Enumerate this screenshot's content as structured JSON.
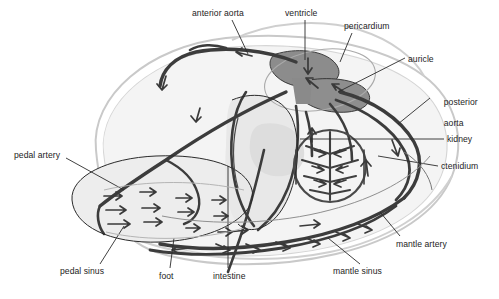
{
  "figure": {
    "type": "anatomical-line-diagram",
    "organism": "bivalve mollusc",
    "colors": {
      "background": "#ffffff",
      "shell_outline": "#c9c9c9",
      "body_fill": "#f2f2f2",
      "visceral_fill": "#e4e4e4",
      "heart_fill": "#8e8e8e",
      "vessel_dark": "#3a3a3a",
      "vessel_mid": "#555555",
      "outline": "#2b2b2b",
      "label_text": "#1d1d1d",
      "leader_line": "#2b2b2b"
    }
  },
  "labels": [
    {
      "id": "anterior-aorta",
      "text": "anterior aorta",
      "x": 192,
      "y": 8,
      "lines": [
        "anterior aorta"
      ]
    },
    {
      "id": "ventricle",
      "text": "ventricle",
      "x": 285,
      "y": 8,
      "lines": [
        "ventricle"
      ]
    },
    {
      "id": "pericardium",
      "text": "pericardium",
      "x": 344,
      "y": 21,
      "lines": [
        "pericardium"
      ]
    },
    {
      "id": "auricle",
      "text": "auricle",
      "x": 408,
      "y": 54,
      "lines": [
        "auricle"
      ]
    },
    {
      "id": "posterior-aorta",
      "text": "posterior aorta",
      "x": 434,
      "y": 88,
      "lines": [
        "posterior",
        "aorta"
      ]
    },
    {
      "id": "kidney",
      "text": "kidney",
      "x": 447,
      "y": 134,
      "lines": [
        "kidney"
      ]
    },
    {
      "id": "ctenidium",
      "text": "ctenidium",
      "x": 441,
      "y": 162,
      "lines": [
        "ctenidium"
      ]
    },
    {
      "id": "mantle-artery",
      "text": "mantle artery",
      "x": 396,
      "y": 240,
      "lines": [
        "mantle artery"
      ]
    },
    {
      "id": "mantle-sinus",
      "text": "mantle sinus",
      "x": 333,
      "y": 267,
      "lines": [
        "mantle sinus"
      ]
    },
    {
      "id": "intestine",
      "text": "intestine",
      "x": 215,
      "y": 272,
      "lines": [
        "intestine"
      ]
    },
    {
      "id": "foot",
      "text": "foot",
      "x": 160,
      "y": 272,
      "lines": [
        "foot"
      ]
    },
    {
      "id": "pedal-sinus",
      "text": "pedal sinus",
      "x": 60,
      "y": 267,
      "lines": [
        "pedal sinus"
      ]
    },
    {
      "id": "pedal-artery",
      "text": "pedal artery",
      "x": 14,
      "y": 150,
      "lines": [
        "pedal artery"
      ]
    }
  ],
  "structures": [
    {
      "id": "shell",
      "name": "shell outline"
    },
    {
      "id": "mantle",
      "name": "mantle"
    },
    {
      "id": "foot-mass",
      "name": "foot"
    },
    {
      "id": "heart",
      "name": "heart (ventricle and auricle)"
    },
    {
      "id": "gill",
      "name": "ctenidium (gill)"
    },
    {
      "id": "kidney",
      "name": "kidney"
    },
    {
      "id": "gut",
      "name": "intestine"
    }
  ]
}
